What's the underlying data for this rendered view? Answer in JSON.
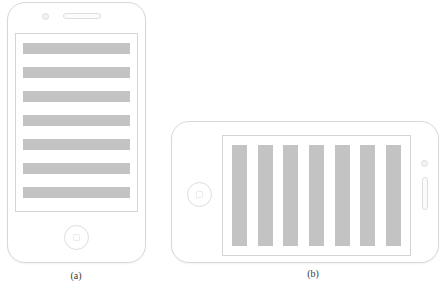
{
  "figure": {
    "caption_a": "(a)",
    "caption_b": "(b)",
    "background_color": "#ffffff",
    "outline_color": "#d8d8d8",
    "bar_color": "#c3c3c3"
  },
  "phone_a": {
    "orientation": "portrait",
    "camera_icon": "camera-dot-icon",
    "speaker_icon": "earpiece-speaker-icon",
    "home_button_icon": "home-button-icon",
    "content_type": "horizontal-text-lines",
    "bar_count": 7,
    "bars": [
      {
        "id": "line-1"
      },
      {
        "id": "line-2"
      },
      {
        "id": "line-3"
      },
      {
        "id": "line-4"
      },
      {
        "id": "line-5"
      },
      {
        "id": "line-6"
      },
      {
        "id": "line-7"
      }
    ]
  },
  "phone_b": {
    "orientation": "landscape",
    "camera_icon": "camera-dot-icon",
    "speaker_icon": "earpiece-speaker-icon",
    "home_button_icon": "home-button-icon",
    "content_type": "vertical-columns",
    "bar_count": 7,
    "bars": [
      {
        "id": "column-1"
      },
      {
        "id": "column-2"
      },
      {
        "id": "column-3"
      },
      {
        "id": "column-4"
      },
      {
        "id": "column-5"
      },
      {
        "id": "column-6"
      },
      {
        "id": "column-7"
      }
    ]
  }
}
